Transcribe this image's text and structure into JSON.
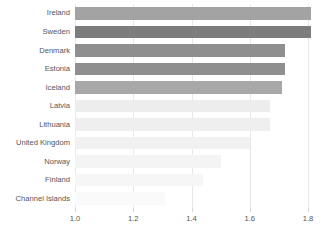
{
  "chart_data": {
    "type": "bar",
    "orientation": "horizontal",
    "title": "",
    "subtitle": "",
    "xlabel": "",
    "ylabel": "",
    "xlim": [
      1.0,
      1.8
    ],
    "grid": true,
    "legend": false,
    "xticks": [
      "1.0",
      "1.2",
      "1.4",
      "1.6",
      "1.8"
    ],
    "xtick_values": [
      1.0,
      1.2,
      1.4,
      1.6,
      1.8
    ],
    "categories": [
      "Ireland",
      "Sweden",
      "Denmark",
      "Estonia",
      "Iceland",
      "Latvia",
      "Lithuania",
      "United Kingdom",
      "Norway",
      "Finland",
      "Channel Islands"
    ],
    "values": [
      1.81,
      1.81,
      1.72,
      1.72,
      1.71,
      1.67,
      1.67,
      1.6,
      1.5,
      1.44,
      1.31
    ],
    "bar_colors": [
      "#a3a3a3",
      "#7d7d7d",
      "#8f8f8f",
      "#8f8f8f",
      "#a8a8a8",
      "#ededed",
      "#efefef",
      "#f1f1f1",
      "#f4f4f4",
      "#f6f6f6",
      "#fafafa"
    ]
  },
  "axis": {
    "tick_color": "#d5d5d5",
    "grid_color": "#e8e8e8",
    "label_color": "#555555"
  },
  "background": "#ffffff"
}
